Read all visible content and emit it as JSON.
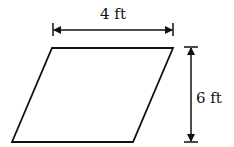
{
  "diagram": {
    "shape": "parallelogram",
    "base_label": "4 ft",
    "height_label": "6 ft",
    "stroke_color": "#111111",
    "background": "#ffffff"
  }
}
